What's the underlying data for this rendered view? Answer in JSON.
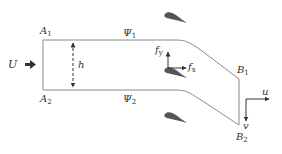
{
  "diagram": {
    "colors": {
      "line": "#8a8a8a",
      "airfoil": "#555555",
      "arrow": "#333333",
      "text": "#333333"
    },
    "labels": {
      "inflow": "U",
      "height": "h",
      "A1": {
        "main": "A",
        "sub": "1"
      },
      "A2": {
        "main": "A",
        "sub": "2"
      },
      "B1": {
        "main": "B",
        "sub": "1"
      },
      "B2": {
        "main": "B",
        "sub": "2"
      },
      "psi1": {
        "main": "Ψ",
        "sub": "1"
      },
      "psi2": {
        "main": "Ψ",
        "sub": "2"
      },
      "fx": {
        "main": "f",
        "sub": "x"
      },
      "fy": {
        "main": "f",
        "sub": "y"
      },
      "u": "u",
      "v": "v"
    },
    "icons": [
      "inflow-arrow-icon",
      "height-dimension-arrow",
      "airfoil-shape",
      "force-axes",
      "velocity-axes"
    ]
  }
}
